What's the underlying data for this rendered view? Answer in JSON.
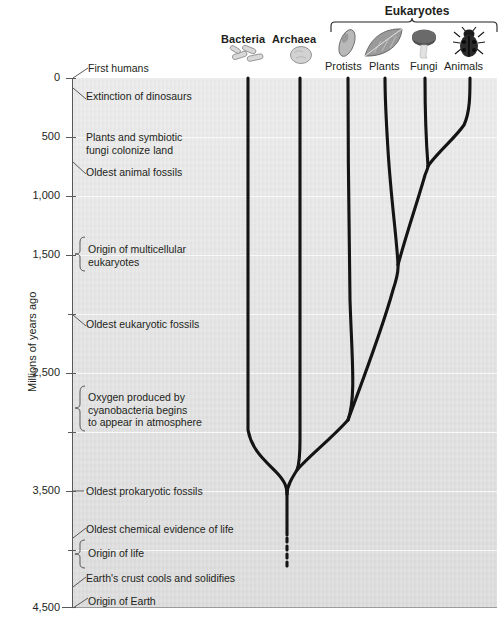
{
  "figure": {
    "axis_title": "Millions of years ago",
    "units": "Millions of years ago"
  },
  "header": {
    "group_label": "Eukaryotes",
    "domains": [
      {
        "label": "Bacteria",
        "icon": "bacteria-icon",
        "x": 248
      },
      {
        "label": "Archaea",
        "icon": "archaea-icon",
        "x": 300
      }
    ],
    "eukaryote_groups": [
      {
        "label": "Protists",
        "icon": "protist-icon",
        "x": 348
      },
      {
        "label": "Plants",
        "icon": "plant-leaf-icon",
        "x": 385
      },
      {
        "label": "Fungi",
        "icon": "mushroom-icon",
        "x": 425
      },
      {
        "label": "Animals",
        "icon": "beetle-icon",
        "x": 470
      }
    ]
  },
  "axis": {
    "ticks": [
      {
        "value": 0,
        "label": "0",
        "y": 78
      },
      {
        "value": 500,
        "label": "500",
        "y": 137
      },
      {
        "value": 1000,
        "label": "1,000",
        "y": 196
      },
      {
        "value": 1500,
        "label": "1,500",
        "y": 255
      },
      {
        "value": 2000,
        "label": "",
        "y": 314
      },
      {
        "value": 2500,
        "label": "2,500",
        "y": 373
      },
      {
        "value": 3000,
        "label": "",
        "y": 432
      },
      {
        "value": 3500,
        "label": "3,500",
        "y": 491
      },
      {
        "value": 4000,
        "label": "",
        "y": 550
      },
      {
        "value": 4500,
        "label": "4,500",
        "y": 608
      }
    ],
    "range": [
      0,
      4500
    ]
  },
  "events": [
    {
      "id": "first-humans",
      "text": "First humans",
      "y": 68,
      "style": "leader"
    },
    {
      "id": "dinosaur-extinction",
      "text": "Extinction of dinosaurs",
      "y": 96,
      "style": "leader"
    },
    {
      "id": "plants-fungi-land",
      "text": "Plants and symbiotic\nfungi colonize land",
      "y": 137,
      "style": "plain"
    },
    {
      "id": "oldest-animal",
      "text": "Oldest animal fossils",
      "y": 170,
      "style": "leader"
    },
    {
      "id": "multicellular-euk",
      "text": "Origin of multicellular\neukaryotes",
      "y": 249,
      "style": "brace"
    },
    {
      "id": "oldest-eukaryotic",
      "text": "Oldest eukaryotic fossils",
      "y": 322,
      "style": "leader"
    },
    {
      "id": "oxygen-cyano",
      "text": "Oxygen produced by\ncyanobacteria begins\nto appear in atmosphere",
      "y": 396,
      "style": "brace"
    },
    {
      "id": "oldest-prokaryotic",
      "text": "Oldest prokaryotic fossils",
      "y": 491,
      "style": "tick"
    },
    {
      "id": "chemical-evidence",
      "text": "Oldest chemical evidence of life",
      "y": 529,
      "style": "leader"
    },
    {
      "id": "origin-of-life",
      "text": "Origin of life",
      "y": 553,
      "style": "brace"
    },
    {
      "id": "crust-solidifies",
      "text": "Earth's crust cools and solidifies",
      "y": 578,
      "style": "leader"
    },
    {
      "id": "origin-of-earth",
      "text": "Origin of Earth",
      "y": 601,
      "style": "leader"
    }
  ],
  "tree": {
    "root_x": 287,
    "root_y": 494,
    "stem_bottom_y": 535,
    "dashed_bottom_y": 566,
    "nodes": [
      {
        "id": "last-universal-ancestor",
        "x": 287,
        "y": 494
      },
      {
        "id": "archaea-eukaryote-split",
        "x": 297,
        "y": 468
      },
      {
        "id": "plant-opisthokont-split",
        "x": 398,
        "y": 265
      },
      {
        "id": "fungi-animal-split",
        "x": 428,
        "y": 166
      }
    ],
    "lineages": [
      {
        "id": "bacteria-lineage",
        "label": "Bacteria"
      },
      {
        "id": "archaea-lineage",
        "label": "Archaea"
      },
      {
        "id": "protist-lineage",
        "label": "Protists"
      },
      {
        "id": "plant-lineage",
        "label": "Plants"
      },
      {
        "id": "fungi-lineage",
        "label": "Fungi"
      },
      {
        "id": "animal-lineage",
        "label": "Animals"
      }
    ]
  },
  "colors": {
    "line": "#141414",
    "text": "#231f20",
    "axis": "#58585a",
    "plot_bg": "#e4e4e4",
    "gridline": "#ffffff"
  }
}
